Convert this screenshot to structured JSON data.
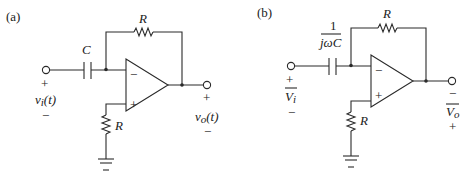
{
  "figure": {
    "panels": [
      {
        "id": "a",
        "label": "(a)",
        "capacitor_label": "C",
        "feedback_resistor_label": "R",
        "ground_resistor_label": "R",
        "opamp_minus": "−",
        "opamp_plus": "+",
        "input": {
          "plus": "+",
          "minus": "−",
          "voltage_label": "v",
          "voltage_sub": "i",
          "voltage_arg": "(t)"
        },
        "output": {
          "top_sign": "+",
          "bottom_sign": "−",
          "voltage_label": "v",
          "voltage_sub": "o",
          "voltage_arg": "(t)"
        }
      },
      {
        "id": "b",
        "label": "(b)",
        "capacitor_label_numerator": "1",
        "capacitor_label_denominator": "jωC",
        "feedback_resistor_label": "R",
        "ground_resistor_label": "R",
        "opamp_minus": "−",
        "opamp_plus": "+",
        "input": {
          "plus": "+",
          "minus": "−",
          "voltage_label": "V",
          "voltage_sub": "i"
        },
        "output": {
          "top_sign": "−",
          "bottom_sign": "+",
          "voltage_label": "V",
          "voltage_sub": "o"
        }
      }
    ],
    "colors": {
      "ink": "#2a2a2a",
      "background": "#ffffff"
    }
  }
}
